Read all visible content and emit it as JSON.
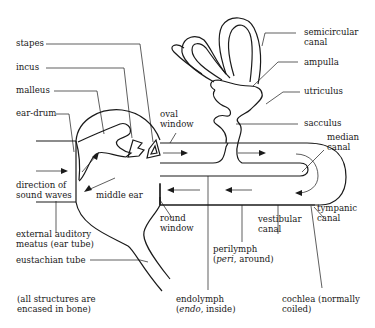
{
  "diagram": {
    "type": "anatomy-schematic",
    "labels": {
      "stapes": "stapes",
      "incus": "incus",
      "malleus": "malleus",
      "ear_drum": "ear-drum",
      "oval_window_1": "oval",
      "oval_window_2": "window",
      "direction_1": "direction of",
      "direction_2": "sound waves",
      "middle_ear": "middle ear",
      "external_1": "external auditory",
      "external_2": "meatus (ear tube)",
      "eustachian": "eustachian tube",
      "note_1": "(all structures are",
      "note_2": "encased in bone)",
      "round_window_1": "round",
      "round_window_2": "window",
      "semicircular_1": "semicircular",
      "semicircular_2": "canal",
      "ampulla": "ampulla",
      "utriculus": "utriculus",
      "sacculus": "sacculus",
      "median_1": "median",
      "median_2": "canal",
      "vestibular_1": "vestibular",
      "vestibular_2": "canal",
      "tympanic_1": "tympanic",
      "tympanic_2": "canal",
      "perilymph_1": "perilymph",
      "perilymph_2_italic": "peri",
      "perilymph_2_rest": ", around)",
      "endolymph_1": "endolymph",
      "endolymph_2_italic": "endo",
      "endolymph_2_rest": ", inside)",
      "cochlea_1": "cochlea (normally",
      "cochlea_2": "coiled)"
    },
    "flow_arrows": {
      "upper_canal": "left-to-right",
      "lower_canal": "right-to-left",
      "turn": "clockwise around helicotrema"
    }
  }
}
